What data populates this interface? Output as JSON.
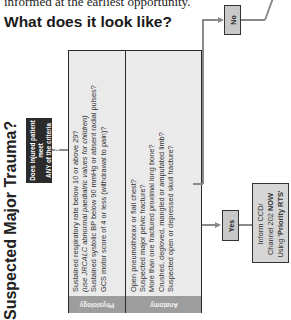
{
  "intro": {
    "text": "informed at the earliest opportunity."
  },
  "heading": "What does it look like?",
  "title": "Suspected Major Trauma?",
  "question": {
    "line1": "Does injured patient meet",
    "line2": "ANY of the criteria below?"
  },
  "table": {
    "columns": [
      {
        "label": "Physiology",
        "criteria": [
          "Sustained respiratory rate below 10 or above 29?",
          "(use JRCALC abnormal paediatric values for children)",
          "Sustained systolic BP below 90 mmHg or absent radial pulses?",
          "GCS motor score of 4 or less (withdrawal to pain)?"
        ]
      },
      {
        "label": "Anatomy",
        "criteria": [
          "Open pneumothorax or flail chest?",
          "Suspected major pelvic fracture?",
          "More than one fractured proximal long bone?",
          "Crushed, degloved, mangled or amputated limb?",
          "Suspected open or depressed skull fracture?"
        ]
      }
    ]
  },
  "no_box": {
    "label": "No"
  },
  "yes_box": {
    "label": "Yes"
  },
  "inform_box": {
    "line1": "Inform CCD/",
    "line2_pre": "Channel 202 ",
    "line2_bold": "NOW",
    "line3_pre": "Using ",
    "line3_bold": "'Priority RTS'"
  },
  "colors": {
    "question_bg": "#2b2b2b",
    "table_bg": "#eaeaea",
    "header_bg": "#9d9d9d",
    "box_gray": "#c8c8c8",
    "connector": "#8a8a8a"
  }
}
